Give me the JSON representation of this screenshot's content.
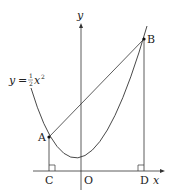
{
  "figure": {
    "type": "coordinate-geometry",
    "curve_label": {
      "lhs": "y",
      "eq": "=",
      "coef_num": "1",
      "coef_den": "2",
      "var": "x",
      "exp": "2"
    },
    "axes": {
      "x_label": "x",
      "y_label": "y"
    },
    "points": {
      "O": "O",
      "A": "A",
      "B": "B",
      "C": "C",
      "D": "D"
    },
    "colors": {
      "stroke": "#333333",
      "point": "#111111",
      "background": "#ffffff"
    }
  }
}
